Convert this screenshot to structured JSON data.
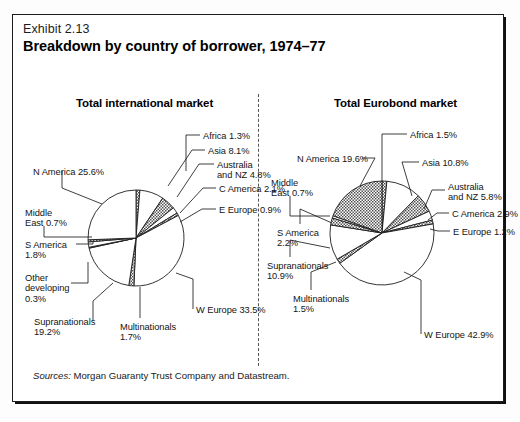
{
  "exhibit": {
    "number": "Exhibit 2.13",
    "title": "Breakdown by country of borrower, 1974–77"
  },
  "source": {
    "lead": "Sources:",
    "text": " Morgan Guaranty Trust Company and Datastream."
  },
  "colors": {
    "ink": "#1c1c1c",
    "paper": "#ffffff",
    "wedge_plain": "#ffffff",
    "wedge_shaded": "#9a9a9a",
    "divider": "#555555"
  },
  "chart_data": [
    {
      "type": "pie",
      "title": "Total international market",
      "units": "percent",
      "start_angle_deg": -90,
      "direction": "clockwise",
      "categories": [
        "Africa",
        "Asia",
        "Australia and NZ",
        "C America",
        "E Europe",
        "W Europe",
        "Multinationals",
        "Supranationals",
        "Other developing",
        "S America",
        "Middle East",
        "N America"
      ],
      "values": [
        1.3,
        8.1,
        4.8,
        2.1,
        0.9,
        33.5,
        1.7,
        19.2,
        0.3,
        1.8,
        0.7,
        25.6
      ],
      "fills": [
        "shaded",
        "plain",
        "shaded",
        "plain",
        "shaded",
        "plain",
        "shaded",
        "plain",
        "shaded",
        "plain",
        "shaded",
        "plain"
      ],
      "labels": [
        "Africa 1.3%",
        "Asia 8.1%",
        "Australia\nand NZ 4.8%",
        "C America 2.1%",
        "E Europe 0.9%",
        "W Europe 33.5%",
        "Multinationals\n1.7%",
        "Supranationals\n19.2%",
        "Other\ndeveloping\n0.3%",
        "S America\n1.8%",
        "Middle\nEast 0.7%",
        "N America 25.6%"
      ]
    },
    {
      "type": "pie",
      "title": "Total Eurobond market",
      "units": "percent",
      "start_angle_deg": -90,
      "direction": "clockwise",
      "categories": [
        "Africa",
        "Asia",
        "Australia and NZ",
        "C America",
        "E Europe",
        "W Europe",
        "Multinationals",
        "Supranationals",
        "S America",
        "Middle East",
        "N America"
      ],
      "values": [
        1.5,
        10.8,
        5.8,
        2.9,
        1.2,
        42.9,
        1.5,
        10.9,
        2.2,
        0.7,
        19.6
      ],
      "fills": [
        "shaded",
        "plain",
        "shaded",
        "plain",
        "shaded",
        "plain",
        "shaded",
        "plain",
        "shaded",
        "plain",
        "shaded"
      ],
      "labels": [
        "Africa 1.5%",
        "Asia 10.8%",
        "Australia\nand NZ 5.8%",
        "C America 2.9%",
        "E Europe 1.2%",
        "W Europe 42.9%",
        "Multinationals\n1.5%",
        "Supranationals\n10.9%",
        "S America\n2.2%",
        "Middle\nEast 0.7%",
        "N America 19.6%"
      ]
    }
  ],
  "left_callouts": [
    {
      "key": "africa",
      "text": "Africa 1.3%",
      "x": 203,
      "y": 131,
      "align": "left"
    },
    {
      "key": "asia",
      "text": "Asia 8.1%",
      "x": 208,
      "y": 146,
      "align": "left"
    },
    {
      "key": "australia",
      "text": "Australia\nand NZ 4.8%",
      "x": 217,
      "y": 160,
      "align": "left"
    },
    {
      "key": "c-america",
      "text": "C America 2.1%",
      "x": 219,
      "y": 184,
      "align": "left"
    },
    {
      "key": "e-europe",
      "text": "E Europe 0.9%",
      "x": 219,
      "y": 205,
      "align": "left"
    },
    {
      "key": "w-europe",
      "text": "W Europe 33.5%",
      "x": 196,
      "y": 305,
      "align": "left"
    },
    {
      "key": "multinationals",
      "text": "Multinationals\n1.7%",
      "x": 120,
      "y": 322,
      "align": "left"
    },
    {
      "key": "supranationals",
      "text": "Supranationals\n19.2%",
      "x": 34,
      "y": 317,
      "align": "left"
    },
    {
      "key": "other-dev",
      "text": "Other\ndeveloping\n0.3%",
      "x": 25,
      "y": 273,
      "align": "left"
    },
    {
      "key": "s-america",
      "text": "S America\n1.8%",
      "x": 25,
      "y": 240,
      "align": "left"
    },
    {
      "key": "middle-east",
      "text": "Middle\nEast 0.7%",
      "x": 25,
      "y": 208,
      "align": "left"
    },
    {
      "key": "n-america",
      "text": "N America 25.6%",
      "x": 33,
      "y": 167,
      "align": "left"
    }
  ],
  "right_callouts": [
    {
      "key": "africa",
      "text": "Africa 1.5%",
      "x": 410,
      "y": 130,
      "align": "left"
    },
    {
      "key": "asia",
      "text": "Asia 10.8%",
      "x": 422,
      "y": 158,
      "align": "left"
    },
    {
      "key": "australia",
      "text": "Australia\nand NZ 5.8%",
      "x": 448,
      "y": 182,
      "align": "left"
    },
    {
      "key": "c-america",
      "text": "C America 2.9%",
      "x": 452,
      "y": 209,
      "align": "left"
    },
    {
      "key": "e-europe",
      "text": "E Europe 1.2%",
      "x": 453,
      "y": 227,
      "align": "left"
    },
    {
      "key": "w-europe",
      "text": "W Europe 42.9%",
      "x": 424,
      "y": 330,
      "align": "left"
    },
    {
      "key": "multinationals",
      "text": "Multinationals\n1.5%",
      "x": 293,
      "y": 294,
      "align": "left"
    },
    {
      "key": "supranationals",
      "text": "Supranationals\n10.9%",
      "x": 267,
      "y": 261,
      "align": "left"
    },
    {
      "key": "s-america",
      "text": "S America\n2.2%",
      "x": 277,
      "y": 228,
      "align": "left"
    },
    {
      "key": "middle-east",
      "text": "Middle\nEast 0.7%",
      "x": 271,
      "y": 178,
      "align": "left"
    },
    {
      "key": "n-america",
      "text": "N America 19.6%",
      "x": 297,
      "y": 154,
      "align": "left"
    }
  ],
  "left_leaders": [
    {
      "key": "africa",
      "pts": "200,135 186,135 186,171"
    },
    {
      "key": "asia",
      "pts": "205,150 192,150 168,186"
    },
    {
      "key": "australia",
      "pts": "214,164 199,164 177,197"
    },
    {
      "key": "c-america",
      "pts": "216,188 203,188 180,213"
    },
    {
      "key": "e-europe",
      "pts": "216,209 202,209 180,222"
    },
    {
      "key": "w-europe",
      "pts": "193,309 193,279 176,273"
    },
    {
      "key": "multinationals",
      "pts": "140,318 140,299 140,287"
    },
    {
      "key": "supranationals",
      "pts": "93,321 93,301 113,283"
    },
    {
      "key": "other-dev",
      "pts": "71,283 88,283 88,262"
    },
    {
      "key": "s-america",
      "pts": "76,244 93,244 93,241"
    },
    {
      "key": "middle-east",
      "pts": "44,226 44,237 92,237"
    },
    {
      "key": "n-america",
      "pts": "62,171 62,188 102,204"
    }
  ],
  "right_leaders": [
    {
      "key": "africa",
      "pts": "407,134 382,134 382,182"
    },
    {
      "key": "asia",
      "pts": "419,162 402,162 412,196"
    },
    {
      "key": "australia",
      "pts": "445,190 432,190 424,209"
    },
    {
      "key": "c-america",
      "pts": "449,213 437,213 428,220"
    },
    {
      "key": "e-europe",
      "pts": "450,231 438,231 430,229"
    },
    {
      "key": "w-europe",
      "pts": "421,334 421,280 404,272"
    },
    {
      "key": "multinationals",
      "pts": "311,290 311,272 336,262"
    },
    {
      "key": "supranationals",
      "pts": "290,257 290,240 330,248"
    },
    {
      "key": "s-america",
      "pts": "300,224 300,209 332,223"
    },
    {
      "key": "middle-east",
      "pts": "290,196 290,216 330,216"
    },
    {
      "key": "n-america",
      "pts": "362,158 375,158 360,186"
    }
  ]
}
